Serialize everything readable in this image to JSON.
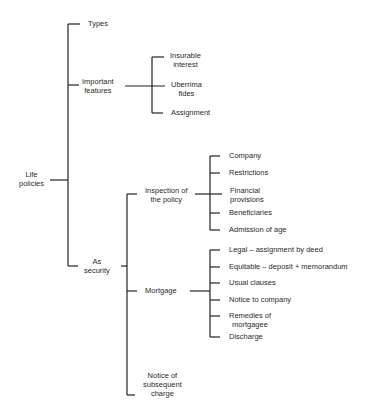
{
  "diagram": {
    "root": {
      "label_line1": "Life",
      "label_line2": "policies"
    },
    "level1": {
      "types": "Types",
      "important_features": {
        "line1": "Important",
        "line2": "features"
      },
      "as_security": {
        "line1": "As",
        "line2": "security"
      }
    },
    "important_features_children": {
      "insurable_interest": {
        "line1": "Insurable",
        "line2": "interest"
      },
      "uberrima_fides": {
        "line1": "Uberrima",
        "line2": "fides"
      },
      "assignment": "Assignment"
    },
    "as_security_children": {
      "inspection": {
        "line1": "Inspection of",
        "line2": "the policy"
      },
      "mortgage": "Mortgage",
      "notice_subsequent": {
        "line1": "Notice of",
        "line2": "subsequent",
        "line3": "charge"
      }
    },
    "inspection_children": {
      "company": "Company",
      "restrictions": "Restrictions",
      "financial": {
        "line1": "Financial",
        "line2": "provisions"
      },
      "beneficiaries": "Beneficiaries",
      "admission": "Admission of age"
    },
    "mortgage_children": {
      "legal": "Legal – assignment by deed",
      "equitable": "Equitable – deposit + memorandum",
      "usual": "Usual clauses",
      "notice_company": "Notice to company",
      "remedies": {
        "line1": "Remedies of",
        "line2": "mortgagee"
      },
      "discharge": "Discharge"
    }
  }
}
